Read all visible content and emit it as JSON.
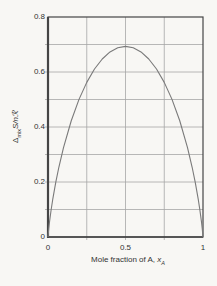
{
  "figure": {
    "bg": "#f8f7f4",
    "text_color": "#333333",
    "axis_color": "#454545",
    "grid_color": "#a6a6a6",
    "curve_color": "#7a7a7a"
  },
  "labels": {
    "ylabel": {
      "delta": "Δ",
      "sub": "mix",
      "rest": "S/nℛ"
    },
    "xlabel": {
      "text": "Mole fraction of A, ",
      "var": "x",
      "sub": "A"
    }
  },
  "chart_data": {
    "type": "line",
    "title": "",
    "xlabel": "Mole fraction of A, x_A",
    "ylabel": "Δ_mix S/nℛ",
    "xlim": [
      0,
      1
    ],
    "ylim": [
      0,
      0.8
    ],
    "grid": {
      "x_values": [
        0.25,
        0.5,
        0.75
      ],
      "y_values": [
        0.1,
        0.2,
        0.3,
        0.4,
        0.5,
        0.6,
        0.7
      ]
    },
    "x_ticks": [
      {
        "value": 0,
        "label": "0"
      },
      {
        "value": 0.5,
        "label": "0.5"
      },
      {
        "value": 1,
        "label": "1"
      }
    ],
    "y_ticks": [
      {
        "value": 0,
        "label": "0"
      },
      {
        "value": 0.2,
        "label": "0.2"
      },
      {
        "value": 0.4,
        "label": "0.4"
      },
      {
        "value": 0.6,
        "label": "0.6"
      },
      {
        "value": 0.8,
        "label": "0.8"
      }
    ],
    "series": [
      {
        "name": "ideal entropy of mixing",
        "peak": {
          "x": 0.5,
          "y": 0.6931
        },
        "x": [
          0,
          0.005,
          0.01,
          0.02,
          0.03,
          0.05,
          0.07,
          0.1,
          0.15,
          0.2,
          0.25,
          0.3,
          0.35,
          0.4,
          0.45,
          0.5,
          0.55,
          0.6,
          0.65,
          0.7,
          0.75,
          0.8,
          0.85,
          0.9,
          0.93,
          0.95,
          0.97,
          0.98,
          0.99,
          0.995,
          1
        ],
        "y": [
          0,
          0.0315,
          0.056,
          0.098,
          0.1347,
          0.1985,
          0.2536,
          0.3251,
          0.4227,
          0.5004,
          0.5623,
          0.6109,
          0.6474,
          0.673,
          0.6881,
          0.6931,
          0.6881,
          0.673,
          0.6474,
          0.6109,
          0.5623,
          0.5004,
          0.4227,
          0.3251,
          0.2536,
          0.1985,
          0.1347,
          0.098,
          0.056,
          0.0315,
          0
        ]
      }
    ]
  }
}
